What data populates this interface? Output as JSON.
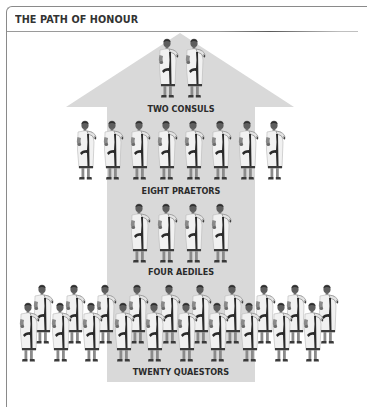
{
  "header": {
    "title": "THE PATH OF HONOUR"
  },
  "colors": {
    "arrow_fill": "#d9d9d9",
    "frame_border": "#8a8a8a",
    "label_text": "#2b2b2b",
    "toga_white": "#f1f1f1",
    "toga_stripe": "#2a2a2a",
    "skin": "#6a6a6a"
  },
  "diagram": {
    "type": "hierarchy-arrow",
    "direction": "up",
    "tiers": [
      {
        "label": "TWO CONSULS",
        "count": 2,
        "icon": "roman-magistrate-figure"
      },
      {
        "label": "EIGHT PRAETORS",
        "count": 8,
        "icon": "roman-magistrate-figure"
      },
      {
        "label": "FOUR AEDILES",
        "count": 4,
        "icon": "roman-magistrate-figure"
      },
      {
        "label": "TWENTY QUAESTORS",
        "count": 20,
        "icon": "roman-magistrate-figure"
      }
    ]
  }
}
